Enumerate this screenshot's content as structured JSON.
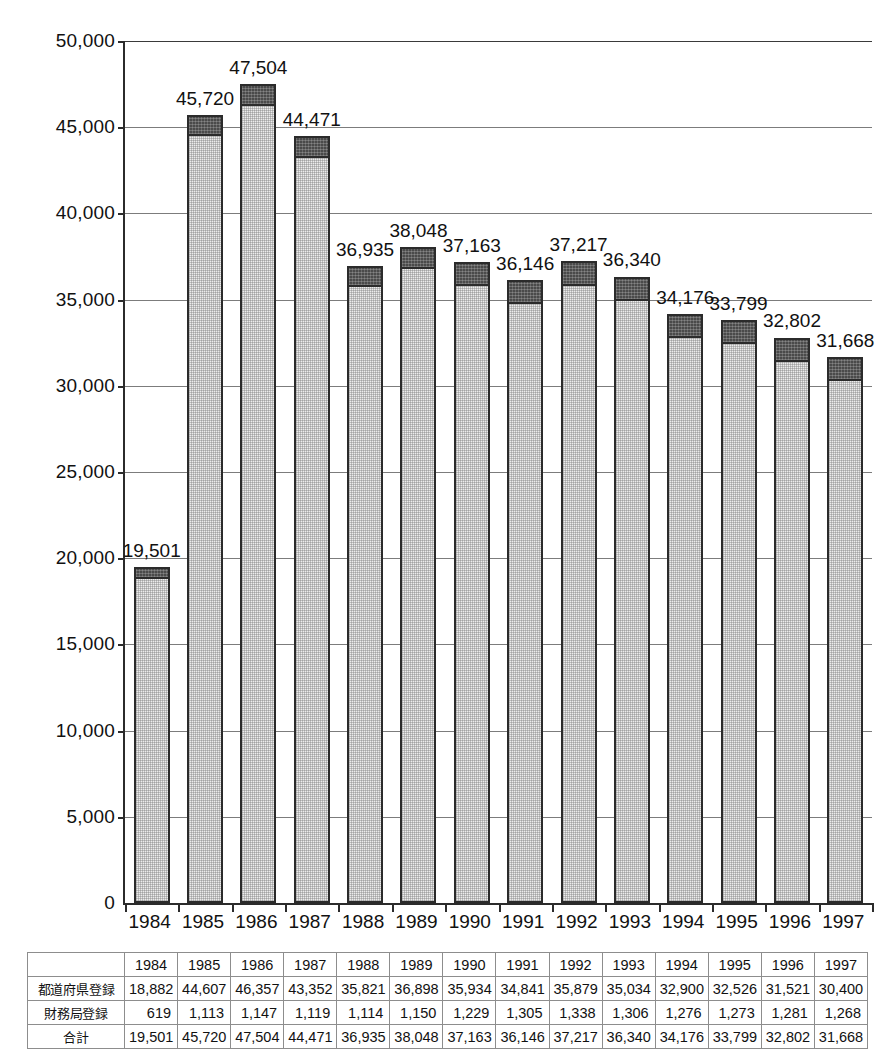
{
  "chart_data": {
    "type": "bar",
    "subtype": "stacked",
    "title": "",
    "xlabel": "",
    "ylabel": "",
    "categories": [
      "1984",
      "1985",
      "1986",
      "1987",
      "1988",
      "1989",
      "1990",
      "1991",
      "1992",
      "1993",
      "1994",
      "1995",
      "1996",
      "1997"
    ],
    "series": [
      {
        "name": "都道府県登録",
        "values": [
          18882,
          44607,
          46357,
          43352,
          35821,
          36898,
          35934,
          34841,
          35879,
          35034,
          32900,
          32526,
          31521,
          30400
        ],
        "color": "#ececec"
      },
      {
        "name": "財務局登録",
        "values": [
          619,
          1113,
          1147,
          1119,
          1114,
          1150,
          1229,
          1305,
          1338,
          1306,
          1276,
          1273,
          1281,
          1268
        ],
        "color": "#4a4a4a"
      }
    ],
    "totals": [
      19501,
      45720,
      47504,
      44471,
      36935,
      38048,
      37163,
      36146,
      37217,
      36340,
      34176,
      33799,
      32802,
      31668
    ],
    "bar_labels": [
      "19,501",
      "45,720",
      "47,504",
      "44,471",
      "36,935",
      "38,048",
      "37,163",
      "36,146",
      "37,217",
      "36,340",
      "34,176",
      "33,799",
      "32,802",
      "31,668"
    ],
    "ylim": [
      0,
      50000
    ],
    "ytick_values": [
      0,
      5000,
      10000,
      15000,
      20000,
      25000,
      30000,
      35000,
      40000,
      45000,
      50000
    ],
    "ytick_labels": [
      "0",
      "5,000",
      "10,000",
      "15,000",
      "20,000",
      "25,000",
      "30,000",
      "35,000",
      "40,000",
      "45,000",
      "50,000"
    ],
    "grid": true,
    "legend": "none"
  },
  "table": {
    "corner_label": "",
    "column_headers": [
      "1984",
      "1985",
      "1986",
      "1987",
      "1988",
      "1989",
      "1990",
      "1991",
      "1992",
      "1993",
      "1994",
      "1995",
      "1996",
      "1997"
    ],
    "rows": [
      {
        "label": "都道府県登録",
        "values": [
          "18,882",
          "44,607",
          "46,357",
          "43,352",
          "35,821",
          "36,898",
          "35,934",
          "34,841",
          "35,879",
          "35,034",
          "32,900",
          "32,526",
          "31,521",
          "30,400"
        ]
      },
      {
        "label": "財務局登録",
        "values": [
          "619",
          "1,113",
          "1,147",
          "1,119",
          "1,114",
          "1,150",
          "1,229",
          "1,305",
          "1,338",
          "1,306",
          "1,276",
          "1,273",
          "1,281",
          "1,268"
        ]
      },
      {
        "label": "合計",
        "values": [
          "19,501",
          "45,720",
          "47,504",
          "44,471",
          "36,935",
          "38,048",
          "37,163",
          "36,146",
          "37,217",
          "36,340",
          "34,176",
          "33,799",
          "32,802",
          "31,668"
        ]
      }
    ]
  }
}
